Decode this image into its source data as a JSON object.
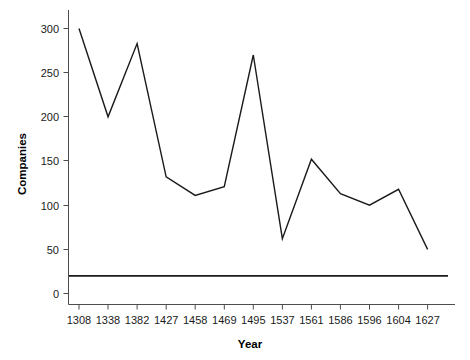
{
  "chart_data": {
    "type": "line",
    "title": "",
    "subtitle": "",
    "xlabel": "Year",
    "ylabel": "Companies",
    "categories": [
      "1308",
      "1338",
      "1382",
      "1427",
      "1458",
      "1469",
      "1495",
      "1537",
      "1561",
      "1586",
      "1596",
      "1604",
      "1627"
    ],
    "x": [
      1308,
      1338,
      1382,
      1427,
      1458,
      1469,
      1495,
      1537,
      1561,
      1586,
      1596,
      1604,
      1627
    ],
    "values": [
      300,
      200,
      283,
      132,
      111,
      121,
      270,
      62,
      152,
      113,
      100,
      118,
      50
    ],
    "series": [
      {
        "name": "Companies",
        "values": [
          300,
          200,
          283,
          132,
          111,
          121,
          270,
          62,
          152,
          113,
          100,
          118,
          50
        ],
        "color": "#1a1a1a"
      }
    ],
    "reference_lines": [
      {
        "name": "baseline",
        "orientation": "horizontal",
        "value": 20,
        "color": "#1a1a1a"
      }
    ],
    "ylim": [
      0,
      312
    ],
    "xlim_category_index": [
      -0.42,
      12.72
    ],
    "yticks": [
      0,
      50,
      100,
      150,
      200,
      250,
      300
    ],
    "ytick_labels": [
      "0",
      "50",
      "100",
      "150",
      "200",
      "250",
      "300"
    ],
    "xtick_labels": [
      "1308",
      "1338",
      "1382",
      "1427",
      "1458",
      "1469",
      "1495",
      "1537",
      "1561",
      "1586",
      "1596",
      "1604",
      "1627"
    ],
    "grid": false,
    "legend": false,
    "legend_position": "none",
    "axis_color": "#4d4d4d",
    "background_color": "#ffffff"
  }
}
